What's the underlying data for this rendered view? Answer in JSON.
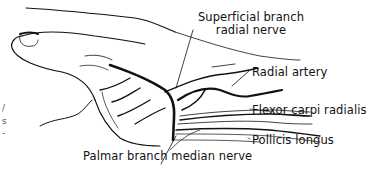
{
  "figure": {
    "type": "anatomical-illustration"
  },
  "labels": {
    "superficial_branch_line1": "Superficial branch",
    "superficial_branch_line2": "radial nerve",
    "radial_artery": "Radial artery",
    "flexor_carpi_radialis": "Flexor carpi radialis",
    "pollicis_longus": "Pollicis longus",
    "palmar_branch": "Palmar branch median nerve"
  },
  "margin_fragments": {
    "line1": "/",
    "line2": "s",
    "line3": "-"
  },
  "colors": {
    "ink": "#111111",
    "background": "#ffffff"
  }
}
